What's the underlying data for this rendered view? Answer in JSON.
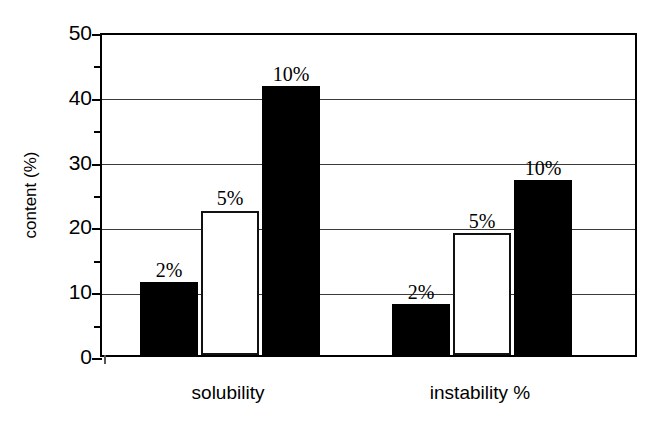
{
  "chart_data": {
    "type": "bar",
    "title": "",
    "xlabel": "",
    "ylabel": "content (%)",
    "ylim": [
      0,
      50
    ],
    "ytick_labels": [
      "0",
      "10",
      "20",
      "30",
      "40",
      "50"
    ],
    "ytick_values": [
      0,
      10,
      20,
      30,
      40,
      50
    ],
    "yminor_values": [
      5,
      15,
      25,
      35,
      45
    ],
    "grid": "horizontal",
    "legend": "none",
    "categories": [
      "solubility",
      "instability %"
    ],
    "series": [
      {
        "name": "2%",
        "values": [
          11.2,
          7.8
        ],
        "fill": "#000000",
        "style": "filled"
      },
      {
        "name": "5%",
        "values": [
          22.3,
          18.8
        ],
        "fill": "#ffffff",
        "style": "open"
      },
      {
        "name": "10%",
        "values": [
          41.5,
          27.0
        ],
        "fill": "#000000",
        "style": "filled"
      }
    ],
    "bar_annotations": [
      {
        "label": "2%",
        "group": "solubility",
        "value": 11.2
      },
      {
        "label": "5%",
        "group": "solubility",
        "value": 22.3
      },
      {
        "label": "10%",
        "group": "solubility",
        "value": 41.5
      },
      {
        "label": "2%",
        "group": "instability %",
        "value": 7.8
      },
      {
        "label": "5%",
        "group": "instability %",
        "value": 18.8
      },
      {
        "label": "10%",
        "group": "instability %",
        "value": 27.0
      }
    ],
    "colors": {
      "axis": "#000000",
      "grid": "#3a3a3a",
      "background": "#ffffff",
      "filled_bar": "#000000",
      "open_bar": "#ffffff"
    }
  }
}
